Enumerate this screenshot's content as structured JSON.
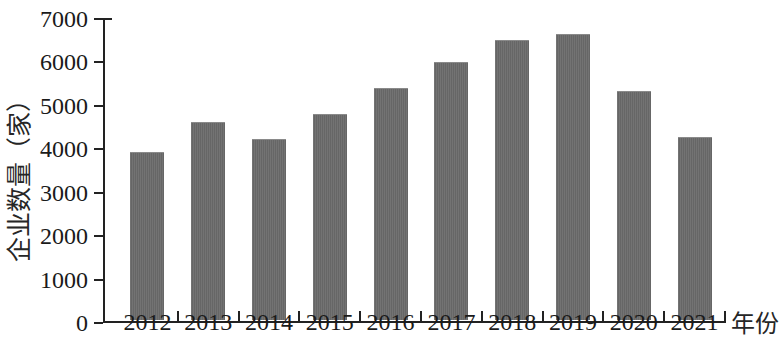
{
  "chart_data": {
    "type": "bar",
    "title": "",
    "subtitle": "",
    "xlabel": "年份",
    "ylabel": "企业数量（家）",
    "categories": [
      "2012",
      "2013",
      "2014",
      "2015",
      "2016",
      "2017",
      "2018",
      "2019",
      "2020",
      "2021"
    ],
    "values": [
      3840,
      4530,
      4140,
      4710,
      5320,
      5910,
      6420,
      6570,
      5250,
      4200
    ],
    "series": [
      {
        "name": "企业数量",
        "values": [
          3840,
          4530,
          4140,
          4710,
          5320,
          5910,
          6420,
          6570,
          5250,
          4200
        ]
      }
    ],
    "ylim": [
      0,
      7000
    ],
    "ytick_labels": [
      "0",
      "1000",
      "2000",
      "3000",
      "4000",
      "5000",
      "6000",
      "7000"
    ],
    "ytick_values": [
      0,
      1000,
      2000,
      3000,
      4000,
      5000,
      6000,
      7000
    ],
    "grid": false,
    "legend": false,
    "legend_position": "none",
    "bar_color": "#6b6b6b",
    "axis_color": "#222222",
    "background_color": "#ffffff"
  }
}
